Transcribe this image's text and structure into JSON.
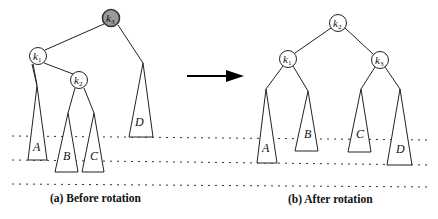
{
  "diagram": {
    "arrow_color": "#000000",
    "highlight_color": "#9a9a9a",
    "before": {
      "caption": "(a) Before rotation",
      "nodes": [
        {
          "id": "k3",
          "label": "k",
          "sub": "3",
          "highlighted": true
        },
        {
          "id": "k1",
          "label": "k",
          "sub": "1"
        },
        {
          "id": "k2",
          "label": "k",
          "sub": "2"
        }
      ],
      "subtrees": [
        "A",
        "B",
        "C",
        "D"
      ]
    },
    "after": {
      "caption": "(b) After rotation",
      "nodes": [
        {
          "id": "k2",
          "label": "k",
          "sub": "2"
        },
        {
          "id": "k1",
          "label": "k",
          "sub": "1"
        },
        {
          "id": "k3",
          "label": "k",
          "sub": "3"
        }
      ],
      "subtrees": [
        "A",
        "B",
        "C",
        "D"
      ]
    }
  }
}
